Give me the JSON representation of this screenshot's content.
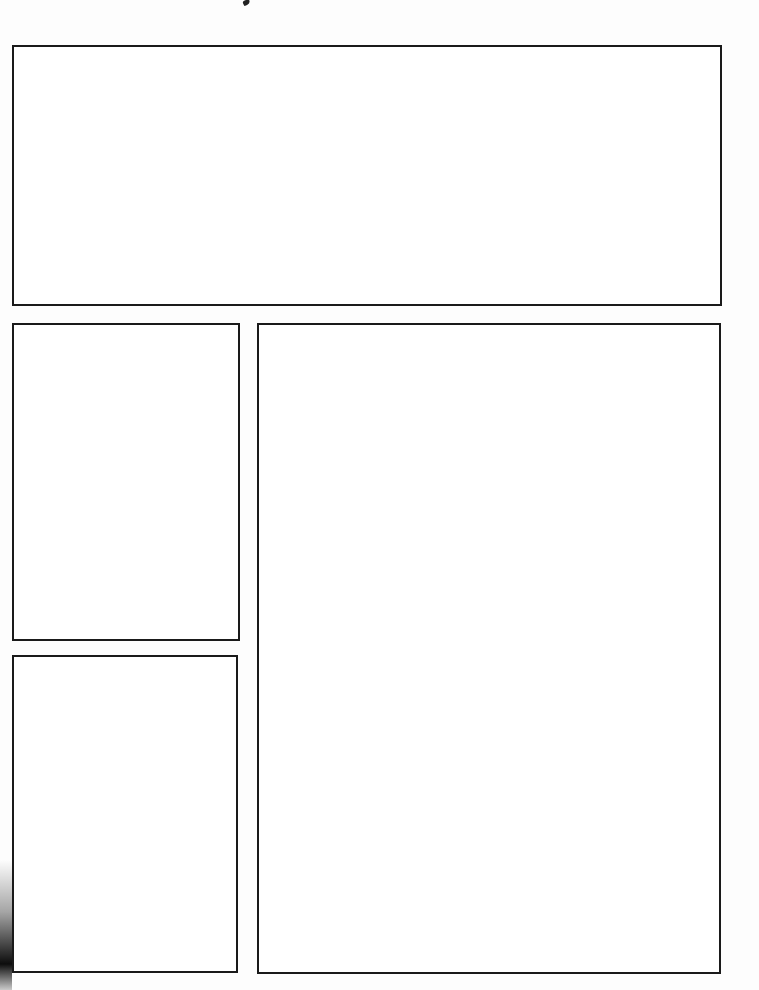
{
  "page": {
    "type": "blank comic storyboard template",
    "background_color": "#fdfdfd",
    "border_color": "#1a1a1a"
  },
  "panels": [
    {
      "id": "top-wide",
      "left": 12,
      "top": 45,
      "width": 710,
      "height": 261
    },
    {
      "id": "left-upper",
      "left": 12,
      "top": 323,
      "width": 228,
      "height": 318
    },
    {
      "id": "left-lower",
      "left": 12,
      "top": 655,
      "width": 226,
      "height": 318
    },
    {
      "id": "right-tall",
      "left": 257,
      "top": 323,
      "width": 464,
      "height": 651
    }
  ]
}
